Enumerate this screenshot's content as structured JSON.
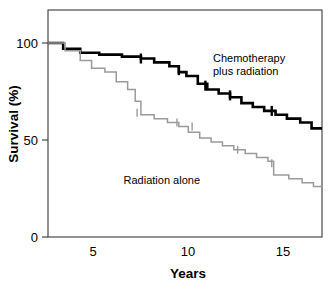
{
  "chart_data": {
    "type": "line",
    "title": "",
    "subtitle": "",
    "xlabel": "Years",
    "ylabel": "Survival (%)",
    "xlim": [
      2.6,
      17.05
    ],
    "ylim": [
      0,
      108
    ],
    "xticks": [
      5,
      10,
      15
    ],
    "xtick_labels": [
      "5",
      "10",
      "15"
    ],
    "yticks": [
      0,
      50,
      100
    ],
    "ytick_labels": [
      "0",
      "50",
      "100"
    ],
    "grid": false,
    "legend_position": "inline-annotations",
    "style": "kaplan-meier step curves with censoring tick marks",
    "series": [
      {
        "name": "Chemotherapy plus radiation",
        "color": "#000000",
        "line_width": "thick",
        "annotation": "Chemotherapy\nplus radiation",
        "annotation_line1": "Chemotherapy",
        "annotation_line2": "plus radiation",
        "x": [
          2.6,
          3.4,
          3.4,
          4.3,
          4.3,
          5.3,
          5.3,
          6.5,
          6.5,
          7.5,
          7.5,
          8.2,
          8.2,
          9.0,
          9.0,
          9.5,
          9.5,
          9.9,
          9.9,
          10.5,
          10.5,
          11.0,
          11.0,
          11.6,
          11.6,
          12.2,
          12.2,
          12.8,
          12.8,
          13.4,
          13.4,
          14.0,
          14.0,
          14.6,
          14.6,
          15.2,
          15.2,
          15.9,
          15.9,
          16.5,
          16.5,
          17.05
        ],
        "y": [
          100,
          100,
          97,
          97,
          95,
          95,
          94,
          94,
          93,
          93,
          92,
          92,
          90,
          90,
          88,
          88,
          85,
          85,
          83,
          83,
          79,
          79,
          76,
          76,
          74,
          74,
          72,
          72,
          69,
          69,
          67,
          67,
          65,
          65,
          63,
          63,
          61,
          61,
          59,
          59,
          56,
          56
        ],
        "censor_times": [
          7.5,
          9.5,
          10.9,
          12.2,
          14.4
        ],
        "censor_values": [
          92,
          86,
          78,
          73,
          65
        ],
        "final_value": 56
      },
      {
        "name": "Radiation alone",
        "color": "#9a9a9a",
        "line_width": "thin",
        "annotation": "Radiation alone",
        "x": [
          2.6,
          3.5,
          3.5,
          4.3,
          4.3,
          4.9,
          4.9,
          5.6,
          5.6,
          6.2,
          6.2,
          6.8,
          6.8,
          7.2,
          7.2,
          7.5,
          7.5,
          8.2,
          8.2,
          8.9,
          8.9,
          9.5,
          9.5,
          10.0,
          10.0,
          10.6,
          10.6,
          11.2,
          11.2,
          11.8,
          11.8,
          12.4,
          12.4,
          13.0,
          13.0,
          13.6,
          13.6,
          14.2,
          14.2,
          14.5,
          14.5,
          15.3,
          15.3,
          16.0,
          16.0,
          16.6,
          16.6,
          17.05
        ],
        "y": [
          100,
          100,
          96,
          96,
          91,
          91,
          87,
          87,
          85,
          85,
          80,
          80,
          76,
          76,
          70,
          70,
          63,
          63,
          61,
          61,
          59,
          59,
          57,
          57,
          54,
          54,
          51,
          51,
          49,
          49,
          47,
          47,
          45,
          45,
          43,
          43,
          41,
          41,
          39,
          39,
          32,
          32,
          30,
          30,
          28,
          28,
          26,
          26
        ],
        "censor_times": [
          7.3,
          9.4,
          10.2,
          12.6,
          14.4
        ],
        "censor_values": [
          64,
          59,
          57,
          45,
          38
        ],
        "final_value": 26
      }
    ]
  },
  "axes": {
    "x_title": "Years",
    "y_title": "Survival (%)"
  }
}
